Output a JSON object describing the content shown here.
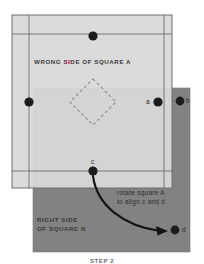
{
  "figure": {
    "caption": "STEP 2",
    "labels": {
      "square_a": "WRONG SIDE OF SQUARE A",
      "square_b_line1": "RIGHT SIDE",
      "square_b_line2": "OF SQUARE B",
      "instruction_line1": "rotate square A",
      "instruction_line2": "to align c and d"
    },
    "points": [
      {
        "id": "top",
        "label": "",
        "x": 93,
        "y": 36,
        "r": 4.6
      },
      {
        "id": "left",
        "label": "",
        "x": 29,
        "y": 102,
        "r": 4.6
      },
      {
        "id": "a",
        "label": "a",
        "x": 158,
        "y": 102,
        "r": 4.6
      },
      {
        "id": "b",
        "label": "b",
        "x": 180,
        "y": 101,
        "r": 4.4
      },
      {
        "id": "c",
        "label": "c",
        "x": 93,
        "y": 171,
        "r": 4.6
      },
      {
        "id": "d",
        "label": "d",
        "x": 175,
        "y": 230,
        "r": 4.4
      }
    ],
    "colors": {
      "square_a_fill": "#d9d9d9",
      "square_b_fill": "#828282",
      "outline": "#6e6e6e",
      "dot": "#1c1c1c",
      "arrow": "#141414",
      "dashed_diamond": "#8c8c8c",
      "page_background": "#ffffff"
    },
    "shapes": {
      "square_a": {
        "x": 12,
        "y": 15,
        "w": 160,
        "h": 173
      },
      "square_b": {
        "x": 33,
        "y": 88,
        "w": 157,
        "h": 164
      },
      "inner_frame": {
        "x": 29,
        "y": 34,
        "w": 135,
        "h": 137
      },
      "dashed_diamond": {
        "cx": 93,
        "cy": 102,
        "rx": 23,
        "ry": 23
      }
    }
  }
}
